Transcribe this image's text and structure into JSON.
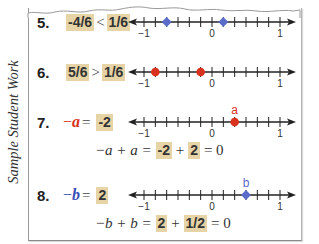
{
  "side_label": "Sample Student Work",
  "colors": {
    "highlight": "#e6d4a6",
    "red_point": "#d8321e",
    "blue_point": "#5a6cc8",
    "axis": "#222222"
  },
  "problems": [
    {
      "number": "5.",
      "left": "-4/6",
      "operator": "<",
      "right": "1/6",
      "number_line": {
        "min_label": "−1",
        "zero_label": "0",
        "max_label": "1",
        "points": [
          {
            "value": -0.6667,
            "color": "blue",
            "shape": "diamond"
          },
          {
            "value": 0.1667,
            "color": "blue",
            "shape": "diamond"
          }
        ]
      }
    },
    {
      "number": "6.",
      "left": "5/6",
      "operator": ">",
      "right": "1/6",
      "number_line": {
        "min_label": "−1",
        "zero_label": "0",
        "max_label": "1",
        "points": [
          {
            "value": -0.8333,
            "color": "red",
            "shape": "circle"
          },
          {
            "value": -0.1667,
            "color": "red",
            "shape": "circle"
          }
        ]
      }
    },
    {
      "number": "7.",
      "lhs_neg": "−",
      "lhs_var": "a",
      "equals": "=",
      "answer": "-2",
      "point_label": "a",
      "number_line": {
        "min_label": "−1",
        "zero_label": "0",
        "max_label": "1",
        "points": [
          {
            "value": 0.3333,
            "color": "red",
            "shape": "circle",
            "label": "a"
          }
        ]
      },
      "equation": {
        "prefix": "−a + a =",
        "box1": "-2",
        "plus": "+",
        "box2": "2",
        "suffix": "= 0"
      }
    },
    {
      "number": "8.",
      "lhs_neg": "−",
      "lhs_var": "b",
      "equals": "=",
      "answer": "2",
      "point_label": "b",
      "number_line": {
        "min_label": "−1",
        "zero_label": "0",
        "max_label": "1",
        "points": [
          {
            "value": 0.5,
            "color": "blue",
            "shape": "diamond",
            "label": "b"
          }
        ]
      },
      "equation": {
        "prefix": "−b + b =",
        "box1": "2",
        "plus": "+",
        "box2": "1/2",
        "suffix": "= 0"
      }
    }
  ]
}
